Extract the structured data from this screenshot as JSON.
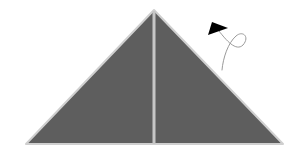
{
  "diagram": {
    "type": "origami-fold-step",
    "width": 305,
    "height": 155,
    "background": "#ffffff",
    "paper": {
      "shape": "triangle",
      "points": [
        [
          154,
          10
        ],
        [
          26,
          144
        ],
        [
          283,
          144
        ]
      ],
      "fill": "#5e5e5e",
      "edge_color": "#cfcfcf"
    },
    "crease": {
      "kind": "vertical-center-crease",
      "x1": 154,
      "y1": 11,
      "x2": 154,
      "y2": 144,
      "color": "#c6c6c6",
      "width": 3
    },
    "arrow": {
      "kind": "turn-over-arrow",
      "head_points": [
        [
          208,
          35
        ],
        [
          212,
          22
        ],
        [
          228,
          28
        ]
      ],
      "head_color": "#000000",
      "path_color": "#9a9a9a",
      "path": "M219 31 C 226 40, 236 52, 243 45 C 250 37, 243 30, 236 36 C 228 43, 223 58, 222 70"
    }
  }
}
